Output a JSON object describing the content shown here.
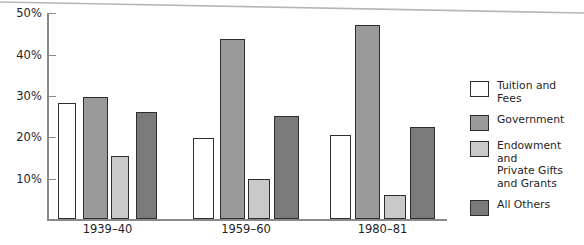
{
  "chart_data": {
    "type": "bar",
    "title": "",
    "subtitle": "",
    "xlabel": "",
    "ylabel": "",
    "categories": [
      "1939–40",
      "1959–60",
      "1980–81"
    ],
    "ylim": [
      0,
      50
    ],
    "ytick_labels": [
      "10%",
      "20%",
      "30%",
      "40%",
      "50%"
    ],
    "ytick_values": [
      10,
      20,
      30,
      40,
      50
    ],
    "grid": false,
    "legend_position": "right",
    "series": [
      {
        "name": "Tuition and Fees",
        "color": "#ffffff",
        "values": [
          28,
          19.7,
          20.3
        ]
      },
      {
        "name": "Government",
        "color": "#9a9a9a",
        "values": [
          29.5,
          43.7,
          47
        ]
      },
      {
        "name": "Endowment and\nPrivate Gifts\nand Grants",
        "color": "#c9c9c9",
        "values": [
          15.3,
          9.8,
          5.7
        ]
      },
      {
        "name": "All Others",
        "color": "#7a7a7a",
        "values": [
          26,
          25,
          22.4
        ]
      }
    ]
  },
  "axis": {
    "tick_0": "10%",
    "tick_1": "20%",
    "tick_2": "30%",
    "tick_3": "40%",
    "tick_4": "50%"
  },
  "groups": {
    "g0": "1939–40",
    "g1": "1959–60",
    "g2": "1980–81"
  },
  "legend": {
    "item_0": "Tuition and Fees",
    "item_1": "Government",
    "item_2": "Endowment and\nPrivate Gifts\nand Grants",
    "item_3": "All Others"
  }
}
